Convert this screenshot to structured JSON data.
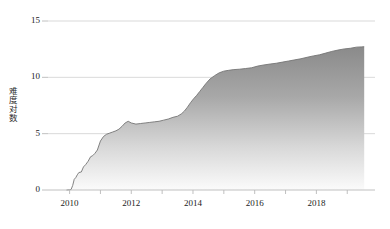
{
  "chart_data": {
    "type": "area",
    "title": "",
    "subtitle": "",
    "xlabel": "",
    "ylabel": "难度对数",
    "xlim": [
      2009.3,
      2019.9
    ],
    "ylim": [
      0,
      15.8
    ],
    "grid": true,
    "grid_axis": "y",
    "legend": false,
    "legend_position": "none",
    "yticks": [
      0,
      5,
      10,
      15
    ],
    "ytick_labels": [
      "0",
      "5",
      "10",
      "15"
    ],
    "xticks": [
      2010,
      2012,
      2014,
      2016,
      2018
    ],
    "xtick_labels": [
      "2010",
      "2012",
      "2014",
      "2016",
      "2018"
    ],
    "xminor_ticks": [
      2011,
      2013,
      2015,
      2017,
      2019
    ],
    "series": [
      {
        "name": "难度对数",
        "fill": "gradient-gray",
        "fill_top_color": "#8e8e8e",
        "fill_bottom_color": "#f4f4f4",
        "line_color": "#6f6f6f",
        "x": [
          2009.9,
          2010.0,
          2010.05,
          2010.1,
          2010.15,
          2010.2,
          2010.25,
          2010.3,
          2010.38,
          2010.45,
          2010.52,
          2010.6,
          2010.68,
          2010.75,
          2010.82,
          2010.9,
          2011.0,
          2011.1,
          2011.2,
          2011.3,
          2011.4,
          2011.5,
          2011.6,
          2011.7,
          2011.8,
          2011.9,
          2012.0,
          2012.15,
          2012.3,
          2012.45,
          2012.6,
          2012.75,
          2012.9,
          2013.05,
          2013.2,
          2013.35,
          2013.5,
          2013.62,
          2013.72,
          2013.82,
          2013.92,
          2014.02,
          2014.12,
          2014.22,
          2014.32,
          2014.42,
          2014.55,
          2014.7,
          2014.85,
          2015.0,
          2015.15,
          2015.3,
          2015.5,
          2015.7,
          2015.9,
          2016.1,
          2016.3,
          2016.5,
          2016.7,
          2016.9,
          2017.1,
          2017.3,
          2017.5,
          2017.7,
          2017.9,
          2018.1,
          2018.3,
          2018.5,
          2018.7,
          2018.9,
          2019.1,
          2019.3,
          2019.45,
          2019.55
        ],
        "y": [
          0.0,
          0.02,
          0.05,
          0.4,
          0.95,
          1.1,
          1.35,
          1.55,
          1.6,
          2.05,
          2.25,
          2.55,
          2.95,
          3.05,
          3.25,
          3.55,
          4.35,
          4.75,
          4.95,
          5.05,
          5.15,
          5.25,
          5.4,
          5.65,
          5.95,
          6.1,
          5.95,
          5.85,
          5.9,
          5.95,
          6.0,
          6.05,
          6.1,
          6.2,
          6.3,
          6.45,
          6.55,
          6.75,
          7.0,
          7.35,
          7.75,
          8.1,
          8.4,
          8.75,
          9.1,
          9.45,
          9.85,
          10.15,
          10.4,
          10.55,
          10.62,
          10.68,
          10.72,
          10.78,
          10.85,
          11.0,
          11.1,
          11.18,
          11.25,
          11.35,
          11.45,
          11.55,
          11.65,
          11.78,
          11.9,
          12.0,
          12.15,
          12.3,
          12.42,
          12.52,
          12.58,
          12.68,
          12.7,
          12.72
        ]
      }
    ]
  }
}
